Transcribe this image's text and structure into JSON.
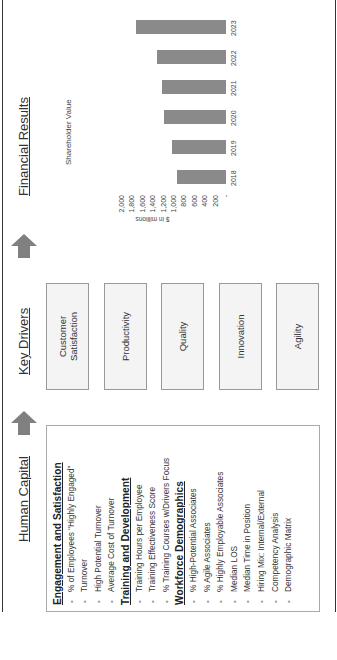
{
  "columns": {
    "human_capital": {
      "title": "Human Capital",
      "sections": [
        {
          "heading": "Engagement and Satisfaction",
          "items": [
            "% of Employees “Highly Engaged”",
            "Turnover",
            "High Potential Turnover",
            "Average Cost of Turnover"
          ]
        },
        {
          "heading": "Training and Development",
          "items": [
            "Training Hours per Employee",
            "Training Effectiveness Score",
            "% Training Courses w/Drivers Focus"
          ]
        },
        {
          "heading": "Workforce Demographics",
          "items": [
            "% High-Potential Associates",
            "% Agile Associates",
            "% Highly Employable Associates",
            "Median LOS",
            "Median Time in Position",
            "Hiring Mix: Internal/External",
            "Competency Analysis",
            "Demographic Matrix"
          ]
        }
      ]
    },
    "key_drivers": {
      "title": "Key Drivers",
      "boxes": [
        "Customer Satisfaction",
        "Productivity",
        "Quality",
        "Innovation",
        "Agility"
      ]
    },
    "financial_results": {
      "title": "Financial Results"
    }
  },
  "arrows": [
    {
      "icon": "arrow-right-icon",
      "color": "#808080"
    },
    {
      "icon": "arrow-right-icon",
      "color": "#808080"
    }
  ],
  "chart_data": {
    "type": "bar",
    "title": "Shareholder Value",
    "categories": [
      "2018",
      "2019",
      "2020",
      "2021",
      "2022",
      "2023"
    ],
    "values": [
      940,
      1040,
      1190,
      1230,
      1330,
      1730
    ],
    "xlabel": "",
    "ylabel": "$ in millions",
    "ylim": [
      0,
      2000
    ],
    "yticks": [
      "-",
      "200",
      "400",
      "600",
      "800",
      "1,000",
      "1,200",
      "1,400",
      "1,600",
      "1,800",
      "2,000"
    ],
    "grid": true,
    "legend": "none",
    "bar_color": "#8a8a8a"
  }
}
